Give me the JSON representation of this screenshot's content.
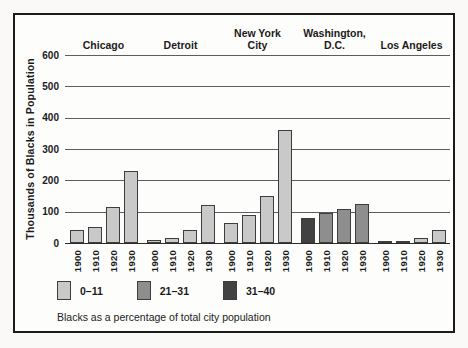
{
  "figure": {
    "y_axis_title": "Thousands of Blacks in Population",
    "caption": "Blacks as a percentage of total city population",
    "legend": [
      {
        "label": "0–11",
        "color": "#c9c9c9"
      },
      {
        "label": "21–31",
        "color": "#8e8e8e"
      },
      {
        "label": "31–40",
        "color": "#424242"
      }
    ]
  },
  "chart_data": {
    "type": "bar",
    "title": "",
    "xlabel": "",
    "ylabel": "Thousands of Blacks in Population",
    "ylim": [
      0,
      600
    ],
    "yticks": [
      600,
      500,
      400,
      300,
      200,
      100,
      0
    ],
    "grid": true,
    "legend_position": "bottom-left",
    "legend_note": "Blacks as a percentage of total city population",
    "years": [
      "1900",
      "1910",
      "1920",
      "1930"
    ],
    "groups": [
      {
        "city": "Chicago",
        "city_lines": [
          "Chicago"
        ],
        "values": [
          40,
          50,
          115,
          230
        ],
        "categories": [
          "0–11",
          "0–11",
          "0–11",
          "0–11"
        ]
      },
      {
        "city": "Detroit",
        "city_lines": [
          "Detroit"
        ],
        "values": [
          10,
          15,
          40,
          120
        ],
        "categories": [
          "0–11",
          "0–11",
          "0–11",
          "0–11"
        ]
      },
      {
        "city": "New York City",
        "city_lines": [
          "New York",
          "City"
        ],
        "values": [
          65,
          90,
          150,
          360
        ],
        "categories": [
          "0–11",
          "0–11",
          "0–11",
          "0–11"
        ]
      },
      {
        "city": "Washington, D.C.",
        "city_lines": [
          "Washington,",
          "D.C."
        ],
        "values": [
          80,
          95,
          110,
          125
        ],
        "categories": [
          "31–40",
          "21–31",
          "21–31",
          "21–31"
        ]
      },
      {
        "city": "Los Angeles",
        "city_lines": [
          "Los Angeles"
        ],
        "values": [
          3,
          8,
          15,
          40
        ],
        "categories": [
          "0–11",
          "0–11",
          "0–11",
          "0–11"
        ]
      }
    ]
  }
}
